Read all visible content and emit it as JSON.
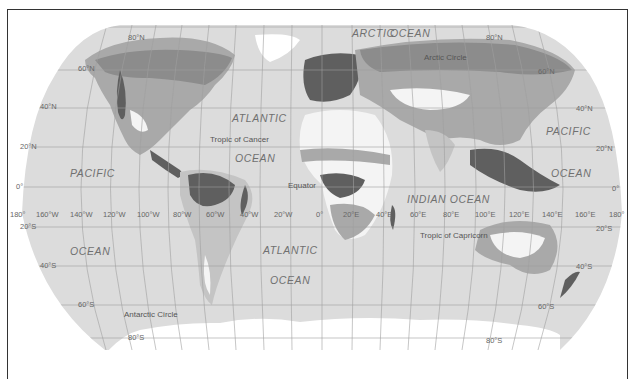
{
  "map": {
    "projection": "Robinson",
    "colors": {
      "ocean": "#dcdcdc",
      "background": "#ffffff",
      "frame": "#333333",
      "graticule": "#b0b0b0",
      "zone_darkest": "#5f5f5f",
      "zone_dark": "#8c8c8c",
      "zone_mid": "#a9a9a9",
      "zone_light": "#c4c4c4",
      "zone_white": "#f4f4f4",
      "ice": "#ffffff"
    },
    "oceans": {
      "arctic_1": "ARCTIC",
      "arctic_2": "OCEAN",
      "atlantic_n_1": "ATLANTIC",
      "atlantic_n_2": "OCEAN",
      "atlantic_s_1": "ATLANTIC",
      "atlantic_s_2": "OCEAN",
      "pacific_w_1": "PACIFIC",
      "pacific_w_2": "OCEAN",
      "pacific_e_1": "PACIFIC",
      "pacific_e_2": "OCEAN",
      "indian": "INDIAN OCEAN"
    },
    "special_lines": {
      "arctic_circle": "Arctic Circle",
      "tropic_cancer": "Tropic of Cancer",
      "equator": "Equator",
      "tropic_capricorn": "Tropic of Capricorn",
      "antarctic_circle": "Antarctic Circle"
    },
    "latitudes_left": [
      "80°N",
      "60°N",
      "40°N",
      "20°N",
      "0°",
      "20°S",
      "40°S",
      "60°S",
      "80°S"
    ],
    "latitudes_right": [
      "80°N",
      "60°N",
      "40°N",
      "20°N",
      "0°",
      "20°S",
      "40°S",
      "60°S",
      "80°S"
    ],
    "longitudes": [
      "180°",
      "160°W",
      "140°W",
      "120°W",
      "100°W",
      "80°W",
      "60°W",
      "40°W",
      "20°W",
      "0°",
      "20°E",
      "40°E",
      "60°E",
      "80°E",
      "100°E",
      "120°E",
      "140°E",
      "160°E",
      "180°"
    ]
  }
}
